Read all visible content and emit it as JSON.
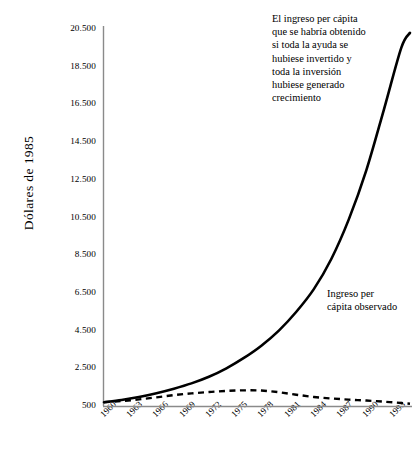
{
  "chart_data": {
    "type": "line",
    "title": "",
    "xlabel": "",
    "ylabel": "Dólares de 1985",
    "xlim": [
      1960,
      1995
    ],
    "ylim": [
      500,
      20500
    ],
    "grid": false,
    "legend_position": "inline-annotations",
    "x_ticks": [
      "1960",
      "1963",
      "1966",
      "1969",
      "1972",
      "1975",
      "1978",
      "1981",
      "1984",
      "1987",
      "1990",
      "1993"
    ],
    "y_ticks": [
      "500",
      "2.500",
      "4.500",
      "6.500",
      "8.500",
      "10.500",
      "12.500",
      "14.500",
      "16.500",
      "18.500",
      "20.500"
    ],
    "y_tick_values": [
      500,
      2500,
      4500,
      6500,
      8500,
      10500,
      12500,
      14500,
      16500,
      18500,
      20500
    ],
    "x": [
      1960,
      1962,
      1964,
      1966,
      1968,
      1970,
      1972,
      1974,
      1976,
      1978,
      1980,
      1982,
      1984,
      1986,
      1988,
      1990,
      1992,
      1994,
      1995
    ],
    "series": [
      {
        "name": "El ingreso per cápita que se habría obtenido si toda la ayuda se hubiese invertido y toda la inversión hubiese generado crecimiento",
        "style": "solid",
        "color": "#000000",
        "values": [
          700,
          820,
          980,
          1180,
          1420,
          1700,
          2050,
          2500,
          3050,
          3700,
          4500,
          5500,
          6700,
          8300,
          10400,
          13000,
          16200,
          19500,
          20300
        ]
      },
      {
        "name": "Ingreso per cápita observado",
        "style": "dashed",
        "color": "#000000",
        "values": [
          700,
          760,
          850,
          960,
          1080,
          1170,
          1240,
          1300,
          1330,
          1320,
          1230,
          1100,
          980,
          900,
          840,
          790,
          730,
          660,
          620
        ]
      }
    ],
    "annotations": [
      {
        "id": "counterfactual",
        "text": "El ingreso per cápita\nque se habría obtenido\nsi toda la ayuda se\nhubiese invertido y\ntoda la inversión\nhubiese generado\ncrecimiento"
      },
      {
        "id": "observed",
        "text": "Ingreso per\ncápita observado"
      }
    ]
  },
  "axes": {
    "y_title": "Dólares de 1985"
  },
  "colors": {
    "ink": "#000000",
    "axis": "#6b6b6b",
    "background": "#ffffff"
  }
}
